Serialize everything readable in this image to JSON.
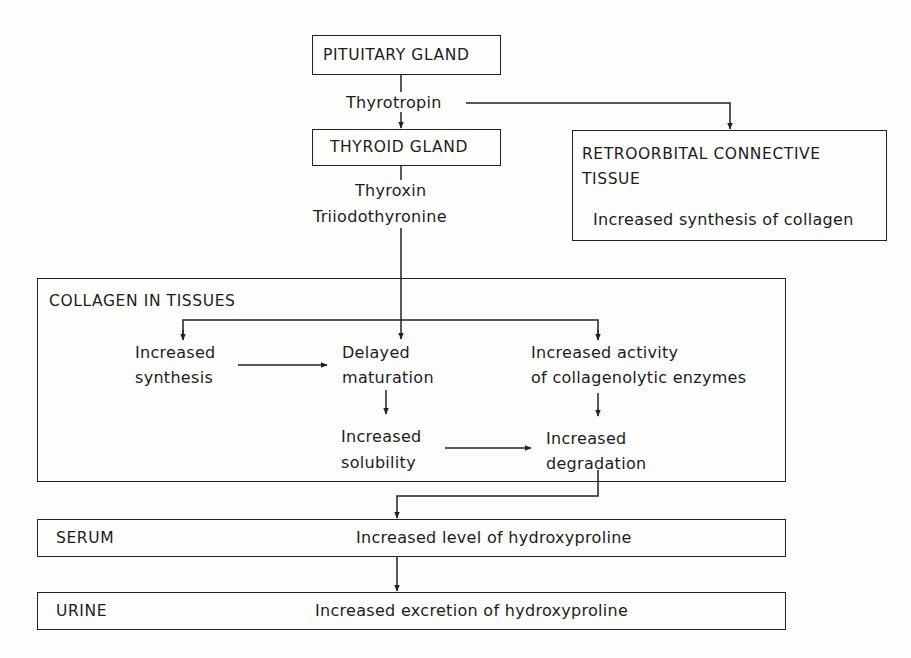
{
  "diagram": {
    "nodes": {
      "pituitary": {
        "label": "PITUITARY GLAND"
      },
      "thyroid": {
        "label": "THYROID GLAND"
      },
      "retroorbital": {
        "title_line1": "RETROORBITAL CONNECTIVE",
        "title_line2": "TISSUE",
        "effect": "Increased synthesis of collagen"
      },
      "collagen": {
        "title": "COLLAGEN IN TISSUES",
        "synthesis": {
          "line1": "Increased",
          "line2": "synthesis"
        },
        "maturation": {
          "line1": "Delayed",
          "line2": "maturation"
        },
        "enzymes": {
          "line1": "Increased activity",
          "line2": "of collagenolytic enzymes"
        },
        "solubility": {
          "line1": "Increased",
          "line2": "solubility"
        },
        "degradation": {
          "line1": "Increased",
          "line2": "degradation"
        }
      },
      "serum": {
        "label": "SERUM",
        "effect": "Increased level of hydroxyproline"
      },
      "urine": {
        "label": "URINE",
        "effect": "Increased excretion of hydroxyproline"
      }
    },
    "edge_labels": {
      "thyrotropin": "Thyrotropin",
      "thyroxin": "Thyroxin",
      "triiodothyronine": "Triiodothyronine"
    },
    "colors": {
      "ink": "#222222",
      "paper": "#fdfdfc"
    }
  }
}
